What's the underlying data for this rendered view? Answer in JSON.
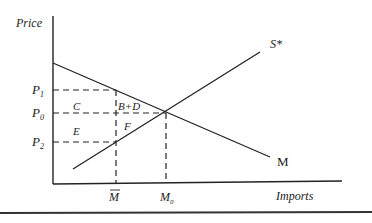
{
  "diagram": {
    "axes": {
      "y_label": "Price",
      "x_label": "Imports"
    },
    "curves": {
      "supply_label": "S*",
      "demand_label": "M"
    },
    "price_levels": {
      "p1": "P",
      "p1_sub": "1",
      "p0": "P",
      "p0_sub": "0",
      "p2": "P",
      "p2_sub": "2"
    },
    "quantity_levels": {
      "m_bar": "M",
      "m0": "M",
      "m0_sub": "0"
    },
    "areas": {
      "c": "C",
      "bd": "B+D",
      "e": "E",
      "f": "F"
    },
    "colors": {
      "line": "#222222",
      "background": "#ffffff"
    }
  }
}
